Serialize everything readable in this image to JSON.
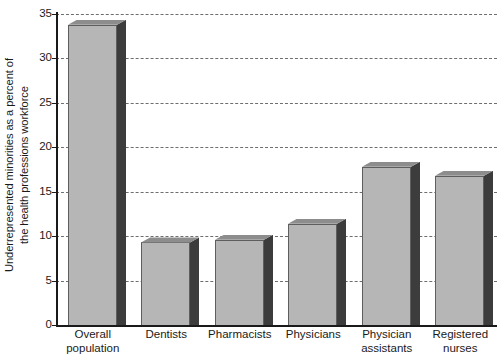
{
  "chart_data": {
    "type": "bar",
    "title": "",
    "xlabel": "",
    "ylabel": "Underrepresented minorities as a percent of the health professions workforce",
    "ylabel_lines": [
      "Underrepresented minorities as a percent of",
      "the health professions workforce"
    ],
    "categories": [
      "Overall population",
      "Dentists",
      "Pharmacists",
      "Physicians",
      "Physician assistants",
      "Registered nurses"
    ],
    "category_lines": [
      [
        "Overall",
        "population"
      ],
      [
        "Dentists"
      ],
      [
        "Pharmacists"
      ],
      [
        "Physicians"
      ],
      [
        "Physician",
        "assistants"
      ],
      [
        "Registered",
        "nurses"
      ]
    ],
    "values": [
      33.8,
      9.3,
      9.6,
      11.4,
      17.8,
      16.8
    ],
    "ylim": [
      0,
      35
    ],
    "yticks": [
      0,
      5,
      10,
      15,
      20,
      25,
      30,
      35
    ],
    "ytick_labels": [
      "0",
      "5",
      "10",
      "15",
      "20",
      "25",
      "30",
      "35"
    ],
    "grid": true,
    "grid_axis": "y",
    "grid_style": "dashed",
    "legend": false,
    "legend_position": "none",
    "bar_style": "3d-extruded",
    "colors": {
      "bar_face": "#b6b6b6",
      "bar_side": "#3c3c3c",
      "bar_top": "#8d8d8d",
      "bar_edge": "#5e5e5e",
      "axis": "#1a1a1a",
      "grid": "#6e6e6e",
      "background": "#ffffff",
      "text": "#1a1a1a"
    }
  }
}
